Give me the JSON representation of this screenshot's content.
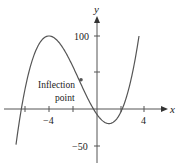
{
  "chart_data": {
    "type": "line",
    "title": "",
    "xlabel": "x",
    "ylabel": "y",
    "x_ticks": [
      -6,
      -4,
      -2,
      2,
      4
    ],
    "x_tick_labels": {
      "-4": "−4",
      "4": "4"
    },
    "y_ticks": [
      -50,
      50,
      100
    ],
    "y_tick_labels": {
      "100": "100",
      "-50": "−50"
    },
    "xlim": [
      -8,
      6.3
    ],
    "ylim": [
      -80,
      150
    ],
    "grid": false,
    "series": [
      {
        "name": "cubic curve",
        "function": "y = 1.92(x^3 + 4.5x^2 - 12x) - 7.5",
        "x": [
          -6.8,
          -6,
          -5,
          -4,
          -3,
          -2,
          -1.5,
          -1,
          0,
          1,
          2,
          3,
          3.5
        ],
        "y": [
          -68,
          10,
          80,
          100,
          84,
          55,
          40,
          23,
          -7.5,
          -20,
          0,
          63,
          100
        ]
      }
    ],
    "annotations": [
      {
        "text": "Inflection point",
        "x": -1.5,
        "y": 40,
        "marker": "dot"
      }
    ]
  },
  "labels": {
    "x_axis": "x",
    "y_axis": "y",
    "tick_neg4": "−4",
    "tick_4": "4",
    "tick_100": "100",
    "tick_neg50": "−50",
    "annotation_line1": "Inflection",
    "annotation_line2": "point"
  },
  "colors": {
    "curve": "#555555",
    "axis": "#555555",
    "text": "#222222",
    "marker": "#555555"
  }
}
